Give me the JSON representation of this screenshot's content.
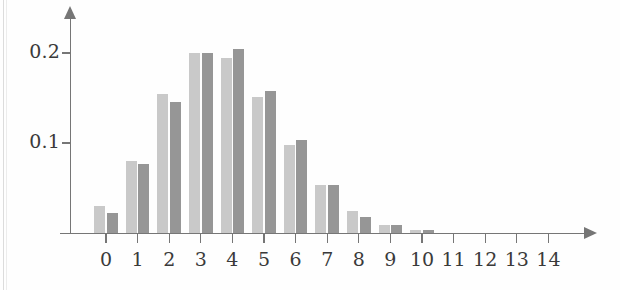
{
  "chart_data": {
    "type": "bar",
    "title": "",
    "subtitle": "",
    "xlabel": "",
    "ylabel": "",
    "grid": false,
    "legend_position": "none",
    "categories": [
      "0",
      "1",
      "2",
      "3",
      "4",
      "5",
      "6",
      "7",
      "8",
      "9",
      "10",
      "11",
      "12",
      "13",
      "14"
    ],
    "xlim": [
      -0.5,
      14.5
    ],
    "ylim": [
      0,
      0.225
    ],
    "ytick_labels": [
      "0.1",
      "0.2"
    ],
    "ytick_values": [
      0.1,
      0.2
    ],
    "series": [
      {
        "name": "light",
        "color": "#c9c9c9",
        "values": [
          0.03,
          0.08,
          0.155,
          0.2,
          0.195,
          0.151,
          0.098,
          0.053,
          0.024,
          0.009,
          0.003,
          0.0,
          0.0,
          0.0,
          0.0
        ]
      },
      {
        "name": "dark",
        "color": "#969696",
        "values": [
          0.022,
          0.077,
          0.146,
          0.2,
          0.205,
          0.158,
          0.103,
          0.053,
          0.018,
          0.009,
          0.003,
          0.0,
          0.0,
          0.0,
          0.0
        ]
      }
    ]
  },
  "axes": {
    "y_axis_name": "y-axis",
    "x_axis_name": "x-axis"
  }
}
